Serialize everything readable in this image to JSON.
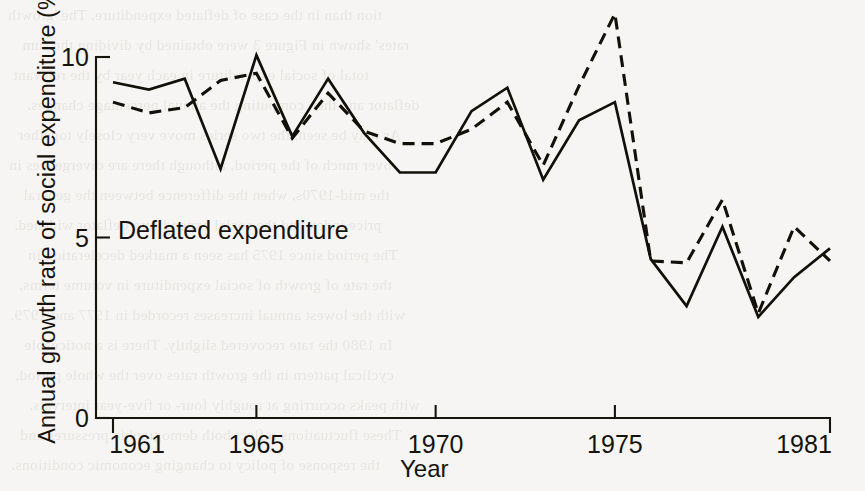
{
  "figure": {
    "background_color": "#f6f5f3",
    "ink_color": "#121009",
    "annotation": "Deflated expenditure"
  },
  "axes": {
    "y_title": "Annual growth rate of social expenditure (%)",
    "x_title": "Year",
    "y_ticks": [
      "0",
      "5",
      "10"
    ],
    "x_ticks": [
      "1961",
      "1965",
      "1970",
      "1975",
      "1981"
    ]
  },
  "bleed_through_lines": [
    "tion than in the case of deflated expenditure. The 'growth",
    "rates' shown in Figure 3 were obtained by dividing the sum",
    "total of social expenditure in each year by the relevant",
    "deflator and then computing the annual percentage changes.",
    "As may be seen, the two series move very closely together",
    "over much of the period, although there are divergences in",
    "the mid-1970s, when the difference between the general",
    "price index and the social expenditure deflator widened.",
    "The period since 1975 has seen a marked deceleration in",
    "the rate of growth of social expenditure in volume terms,",
    "with the lowest annual increases recorded in 1977 and 1979.",
    "In 1980 the rate recovered slightly. There is a noticeable",
    "cyclical pattern in the growth rates over the whole period,",
    "with peaks occurring at roughly four- or five-year intervals.",
    "These fluctuations reflect both demographic pressures and",
    "the response of policy to changing economic conditions."
  ],
  "chart_data": {
    "type": "line",
    "title": "",
    "xlabel": "Year",
    "ylabel": "Annual growth rate of social expenditure (%)",
    "xlim": [
      1961,
      1981
    ],
    "ylim": [
      0,
      10.6
    ],
    "xticks": [
      1961,
      1965,
      1970,
      1975,
      1981
    ],
    "yticks": [
      0,
      5,
      10
    ],
    "grid": false,
    "legend": "none",
    "annotations": [
      {
        "text": "Deflated expenditure",
        "x": 1961.2,
        "y": 5.55
      }
    ],
    "x": [
      1961,
      1962,
      1963,
      1964,
      1965,
      1966,
      1967,
      1968,
      1969,
      1970,
      1971,
      1972,
      1973,
      1974,
      1975,
      1976,
      1977,
      1978,
      1979,
      1980,
      1981
    ],
    "series": [
      {
        "name": "Social expenditure (current, solid)",
        "style": "solid",
        "values": [
          9.3,
          9.1,
          9.4,
          6.9,
          10.05,
          7.8,
          9.4,
          7.9,
          6.8,
          6.8,
          8.5,
          9.15,
          6.6,
          8.25,
          8.75,
          4.4,
          3.1,
          5.3,
          2.8,
          3.9,
          4.7
        ]
      },
      {
        "name": "Deflated expenditure (dashed)",
        "style": "dashed",
        "values": [
          8.75,
          8.45,
          8.6,
          9.35,
          9.55,
          7.75,
          9.0,
          7.95,
          7.6,
          7.6,
          8.0,
          8.75,
          7.0,
          9.2,
          11.2,
          4.35,
          4.3,
          6.05,
          2.9,
          5.3,
          4.35
        ]
      }
    ]
  }
}
